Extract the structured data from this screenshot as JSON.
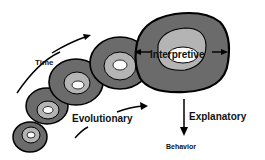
{
  "diagram": {
    "labels": {
      "time": "Time",
      "interpretive": "Interpretive",
      "evolutionary": "Evolutionary",
      "explanatory": "Explanatory",
      "behavior": "Behavior"
    },
    "colors": {
      "outer_ring": "#6b6b6b",
      "middle_ring": "#b4b4b4",
      "inner_core": "#ffffff",
      "outline": "#000000",
      "text": "#111111"
    },
    "nested_shapes_count": 5
  }
}
